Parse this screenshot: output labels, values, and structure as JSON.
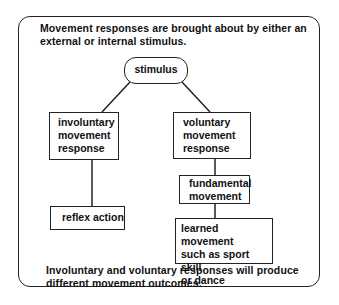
{
  "header": {
    "line1": "Movement responses are brought about by either an",
    "line2": "external or internal stimulus."
  },
  "nodes": {
    "stimulus": "stimulus",
    "involuntary": [
      "involuntary",
      "movement",
      "response"
    ],
    "voluntary": [
      "voluntary",
      "movement",
      "response"
    ],
    "reflex": "reflex action",
    "fundamental": [
      "fundamental",
      "movement"
    ],
    "learned": [
      "learned movement",
      "such as sport skill",
      "or dance"
    ]
  },
  "footer": {
    "line1": "Involuntary and voluntary responses will produce",
    "line2": "different movement outcomes."
  }
}
